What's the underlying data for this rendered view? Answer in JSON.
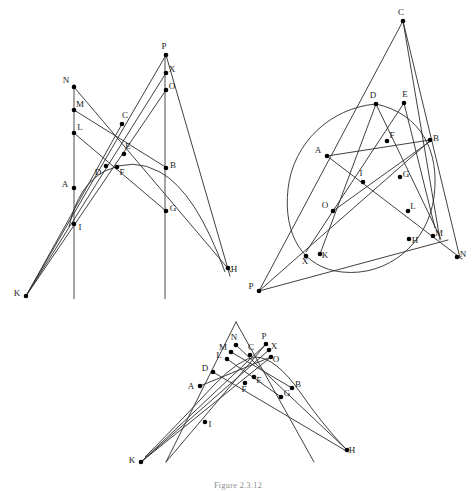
{
  "figure": {
    "caption": "Figure 2.3.12",
    "width": 476,
    "height": 491,
    "background": "#ffffff",
    "stroke_color": "#2b2b2b",
    "axis_color": "#4a4a4a",
    "point_color": "#000000",
    "label_color": "#1a1a1a"
  },
  "panels": [
    {
      "id": "panel-top-left",
      "name": "parabola-pascal-construction",
      "conics": [
        {
          "name": "parabola-arc",
          "type": "path",
          "d": "M 69 227 Q 78 185 105 171 Q 133 157 160 172 Q 196 192 225 272"
        }
      ],
      "axis_lines": [
        {
          "name": "left-vertical-axis",
          "x1": 74,
          "y1": 84,
          "x2": 74,
          "y2": 299
        },
        {
          "name": "right-vertical-axis",
          "x1": 165,
          "y1": 53,
          "x2": 165,
          "y2": 299
        }
      ],
      "lines": [
        {
          "name": "line-N-H",
          "x1": 74,
          "y1": 87,
          "x2": 231,
          "y2": 272
        },
        {
          "name": "line-M-B",
          "x1": 74,
          "y1": 110,
          "x2": 167,
          "y2": 168
        },
        {
          "name": "line-L-G",
          "x1": 74,
          "y1": 133,
          "x2": 166,
          "y2": 211
        },
        {
          "name": "line-K-P",
          "x1": 26,
          "y1": 296,
          "x2": 166,
          "y2": 55
        },
        {
          "name": "line-K-X",
          "x1": 26,
          "y1": 296,
          "x2": 166,
          "y2": 73
        },
        {
          "name": "line-K-O",
          "x1": 26,
          "y1": 296,
          "x2": 166,
          "y2": 90
        },
        {
          "name": "line-P-H-through-D",
          "x1": 166,
          "y1": 55,
          "x2": 230,
          "y2": 276
        },
        {
          "name": "line-C-K-extension",
          "x1": 122,
          "y1": 124,
          "x2": 26,
          "y2": 296
        }
      ],
      "points": [
        {
          "label": "N",
          "x": 74,
          "y": 87,
          "lx": -8,
          "ly": -6
        },
        {
          "label": "M",
          "x": 74,
          "y": 110,
          "lx": 6,
          "ly": -5
        },
        {
          "label": "L",
          "x": 74,
          "y": 133,
          "lx": 6,
          "ly": -5
        },
        {
          "label": "A",
          "x": 74,
          "y": 188,
          "lx": -9,
          "ly": -3
        },
        {
          "label": "I",
          "x": 74,
          "y": 224,
          "lx": 6,
          "ly": 4
        },
        {
          "label": "K",
          "x": 26,
          "y": 296,
          "lx": -9,
          "ly": -2
        },
        {
          "label": "C",
          "x": 122,
          "y": 124,
          "lx": 3,
          "ly": -8
        },
        {
          "label": "E",
          "x": 124,
          "y": 154,
          "lx": 4,
          "ly": -7
        },
        {
          "label": "D",
          "x": 106,
          "y": 166,
          "lx": -8,
          "ly": 7
        },
        {
          "label": "F",
          "x": 117,
          "y": 167,
          "lx": 5,
          "ly": 6
        },
        {
          "label": "P",
          "x": 166,
          "y": 55,
          "lx": -2,
          "ly": -8
        },
        {
          "label": "X",
          "x": 166,
          "y": 73,
          "lx": 6,
          "ly": -3
        },
        {
          "label": "O",
          "x": 166,
          "y": 90,
          "lx": 6,
          "ly": -3
        },
        {
          "label": "B",
          "x": 166,
          "y": 168,
          "lx": 7,
          "ly": -2
        },
        {
          "label": "G",
          "x": 166,
          "y": 211,
          "lx": 7,
          "ly": -2
        },
        {
          "label": "H",
          "x": 228,
          "y": 268,
          "lx": 6,
          "ly": 2
        }
      ]
    },
    {
      "id": "panel-top-right",
      "name": "ellipse-pascal-construction",
      "conics": [
        {
          "name": "ellipse-arc",
          "type": "path",
          "d": "M 376 104 C 330 108 293 143 288 189 C 283 235 303 268 342 272 C 388 277 428 243 434 197 C 440 151 421 114 376 104 Z"
        }
      ],
      "axis_lines": [],
      "lines": [
        {
          "name": "line-C-P",
          "x1": 403,
          "y1": 21,
          "x2": 259,
          "y2": 291
        },
        {
          "name": "line-C-N",
          "x1": 403,
          "y1": 21,
          "x2": 460,
          "y2": 258
        },
        {
          "name": "line-C-H",
          "x1": 403,
          "y1": 21,
          "x2": 440,
          "y2": 240
        },
        {
          "name": "line-D-H",
          "x1": 376,
          "y1": 104,
          "x2": 441,
          "y2": 239
        },
        {
          "name": "line-E-L",
          "x1": 404,
          "y1": 103,
          "x2": 435,
          "y2": 228
        },
        {
          "name": "line-A-B",
          "x1": 327,
          "y1": 156,
          "x2": 430,
          "y2": 140
        },
        {
          "name": "line-A-N",
          "x1": 327,
          "y1": 156,
          "x2": 462,
          "y2": 259
        },
        {
          "name": "line-D-K",
          "x1": 376,
          "y1": 104,
          "x2": 320,
          "y2": 254
        },
        {
          "name": "line-E-X",
          "x1": 404,
          "y1": 103,
          "x2": 306,
          "y2": 252
        },
        {
          "name": "line-P-B",
          "x1": 259,
          "y1": 291,
          "x2": 432,
          "y2": 139
        },
        {
          "name": "line-P-M",
          "x1": 259,
          "y1": 291,
          "x2": 448,
          "y2": 240
        },
        {
          "name": "line-O-B-ext",
          "x1": 333,
          "y1": 211,
          "x2": 432,
          "y2": 140
        }
      ],
      "points": [
        {
          "label": "C",
          "x": 403,
          "y": 21,
          "lx": -2,
          "ly": -8
        },
        {
          "label": "D",
          "x": 376,
          "y": 104,
          "lx": -3,
          "ly": -8
        },
        {
          "label": "E",
          "x": 404,
          "y": 103,
          "lx": 1,
          "ly": -8
        },
        {
          "label": "B",
          "x": 430,
          "y": 140,
          "lx": 6,
          "ly": -1
        },
        {
          "label": "F",
          "x": 387,
          "y": 141,
          "lx": 5,
          "ly": -5
        },
        {
          "label": "A",
          "x": 327,
          "y": 156,
          "lx": -9,
          "ly": -5
        },
        {
          "label": "G",
          "x": 400,
          "y": 177,
          "lx": 6,
          "ly": -2
        },
        {
          "label": "I",
          "x": 363,
          "y": 182,
          "lx": -2,
          "ly": -8
        },
        {
          "label": "O",
          "x": 333,
          "y": 211,
          "lx": -8,
          "ly": -5
        },
        {
          "label": "L",
          "x": 408,
          "y": 211,
          "lx": 5,
          "ly": -4
        },
        {
          "label": "H",
          "x": 409,
          "y": 239,
          "lx": 6,
          "ly": 2
        },
        {
          "label": "M",
          "x": 433,
          "y": 236,
          "lx": 6,
          "ly": -2
        },
        {
          "label": "N",
          "x": 457,
          "y": 257,
          "lx": 6,
          "ly": -2
        },
        {
          "label": "K",
          "x": 320,
          "y": 254,
          "lx": 5,
          "ly": 2
        },
        {
          "label": "X",
          "x": 306,
          "y": 256,
          "lx": -1,
          "ly": 6
        },
        {
          "label": "P",
          "x": 259,
          "y": 291,
          "lx": -8,
          "ly": -4
        }
      ]
    },
    {
      "id": "panel-bottom",
      "name": "degenerate-pascal-construction",
      "conics": [
        {
          "name": "parabola-arc-small",
          "type": "path",
          "d": "M 145 457 Q 178 424 214 385 Q 240 358 256 357 Q 276 358 300 392 Q 322 424 345 448"
        }
      ],
      "axis_lines": [],
      "lines": [
        {
          "name": "line-K-P",
          "x1": 141,
          "y1": 462,
          "x2": 266,
          "y2": 344
        },
        {
          "name": "line-K-X",
          "x1": 141,
          "y1": 462,
          "x2": 269,
          "y2": 350
        },
        {
          "name": "line-K-O",
          "x1": 141,
          "y1": 462,
          "x2": 271,
          "y2": 357
        },
        {
          "name": "line-N-H",
          "x1": 236,
          "y1": 345,
          "x2": 347,
          "y2": 450
        },
        {
          "name": "line-M-B",
          "x1": 231,
          "y1": 352,
          "x2": 292,
          "y2": 388
        },
        {
          "name": "line-L-G",
          "x1": 227,
          "y1": 359,
          "x2": 281,
          "y2": 397
        },
        {
          "name": "line-P-K-long",
          "x1": 266,
          "y1": 344,
          "x2": 166,
          "y2": 462
        },
        {
          "name": "line-apex-left",
          "x1": 236,
          "y1": 322,
          "x2": 166,
          "y2": 462
        },
        {
          "name": "line-apex-right",
          "x1": 236,
          "y1": 322,
          "x2": 314,
          "y2": 462
        },
        {
          "name": "line-D-H",
          "x1": 213,
          "y1": 372,
          "x2": 348,
          "y2": 452
        },
        {
          "name": "line-A-O",
          "x1": 200,
          "y1": 386,
          "x2": 271,
          "y2": 357
        }
      ],
      "points": [
        {
          "label": "N",
          "x": 236,
          "y": 345,
          "lx": -2,
          "ly": -7
        },
        {
          "label": "P",
          "x": 266,
          "y": 344,
          "lx": -2,
          "ly": -7
        },
        {
          "label": "M",
          "x": 231,
          "y": 352,
          "lx": -8,
          "ly": -4
        },
        {
          "label": "X",
          "x": 269,
          "y": 350,
          "lx": 5,
          "ly": -3
        },
        {
          "label": "C",
          "x": 250,
          "y": 355,
          "lx": 1,
          "ly": -7
        },
        {
          "label": "L",
          "x": 227,
          "y": 359,
          "lx": -8,
          "ly": -3
        },
        {
          "label": "O",
          "x": 271,
          "y": 357,
          "lx": 5,
          "ly": 3
        },
        {
          "label": "D",
          "x": 213,
          "y": 372,
          "lx": -8,
          "ly": -3
        },
        {
          "label": "E",
          "x": 254,
          "y": 377,
          "lx": 5,
          "ly": 4
        },
        {
          "label": "B",
          "x": 292,
          "y": 388,
          "lx": 6,
          "ly": -3
        },
        {
          "label": "F",
          "x": 245,
          "y": 383,
          "lx": -1,
          "ly": 7
        },
        {
          "label": "A",
          "x": 200,
          "y": 386,
          "lx": -9,
          "ly": 1
        },
        {
          "label": "G",
          "x": 281,
          "y": 397,
          "lx": 6,
          "ly": -3
        },
        {
          "label": "I",
          "x": 205,
          "y": 422,
          "lx": 5,
          "ly": 3
        },
        {
          "label": "K",
          "x": 141,
          "y": 462,
          "lx": -9,
          "ly": -1
        },
        {
          "label": "H",
          "x": 347,
          "y": 450,
          "lx": 5,
          "ly": 1
        }
      ]
    }
  ]
}
